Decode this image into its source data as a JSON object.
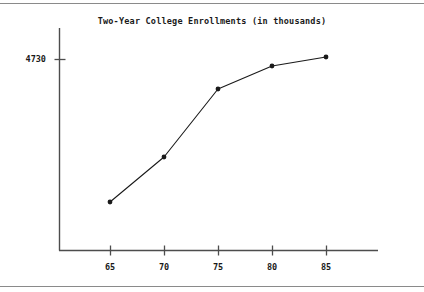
{
  "document": {
    "top_rule": "",
    "bottom_rule": ""
  },
  "chart_data": {
    "type": "line",
    "title": "Two-Year College Enrollments (in thousands)",
    "xlabel": "",
    "ylabel": "",
    "categories": [
      "65",
      "70",
      "75",
      "80",
      "85"
    ],
    "x": [
      65,
      70,
      75,
      80,
      85
    ],
    "values": [
      1950,
      2850,
      4200,
      4580,
      4730
    ],
    "series": [
      {
        "name": "Two-Year College Enrollments",
        "values": [
          1950,
          2850,
          4200,
          4580,
          4730
        ]
      }
    ],
    "ytick_labels": [
      "4730"
    ],
    "ytick_values": [
      4730
    ],
    "xtick_labels": [
      "65",
      "70",
      "75",
      "80",
      "85"
    ],
    "ylim": [
      0,
      5000
    ],
    "xlim": [
      62.5,
      87.5
    ],
    "grid": false,
    "legend": "none",
    "marker": "filled-circle",
    "line_color": "#1a1a1a",
    "axis_color": "#4d4d4d",
    "pixel_points": [
      {
        "x": 110,
        "y": 202
      },
      {
        "x": 164,
        "y": 157
      },
      {
        "x": 218,
        "y": 89
      },
      {
        "x": 272,
        "y": 66
      },
      {
        "x": 326,
        "y": 57
      }
    ]
  }
}
